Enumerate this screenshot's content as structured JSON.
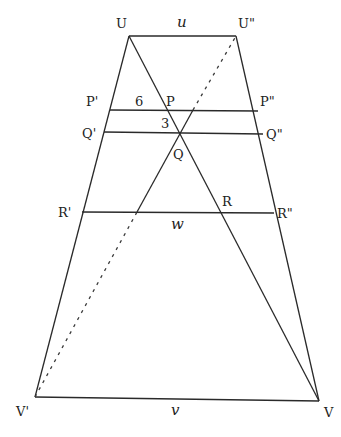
{
  "diagram": {
    "points": {
      "U": {
        "label": "U",
        "x": 129,
        "y": 36
      },
      "U2": {
        "label": "U\"",
        "x": 236,
        "y": 36
      },
      "V1": {
        "label": "V'",
        "x": 35,
        "y": 397
      },
      "V": {
        "label": "V",
        "x": 319,
        "y": 401
      },
      "P1": {
        "label": "P'"
      },
      "P": {
        "label": "P"
      },
      "P2": {
        "label": "P\""
      },
      "Q1": {
        "label": "Q'"
      },
      "Q": {
        "label": "Q"
      },
      "Q2": {
        "label": "Q\""
      },
      "R1": {
        "label": "R'"
      },
      "R": {
        "label": "R"
      },
      "R2": {
        "label": "R\""
      }
    },
    "segment_labels": {
      "top": "u",
      "bottom": "v",
      "middle": "w",
      "p_segment": "6",
      "pq_segment": "3"
    }
  }
}
